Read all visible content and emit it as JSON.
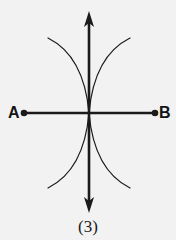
{
  "figure": {
    "caption": "(3)",
    "background_color": "#f2f2f2",
    "ink_color": "#1a1a1a",
    "width": 176,
    "height": 240,
    "points": [
      {
        "id": "A",
        "label": "A",
        "x": 24,
        "y": 113
      },
      {
        "id": "B",
        "label": "B",
        "x": 155,
        "y": 113
      }
    ],
    "origin": {
      "x": 89,
      "y": 113
    },
    "vertical_axis": {
      "name": "vertical-double-arrow",
      "x": 89,
      "y_top": 12,
      "y_bottom": 212,
      "arrowheads": "both",
      "stroke_width": 2.6
    },
    "horizontal_axis": {
      "name": "segment-AB",
      "y": 113,
      "x_left": 24,
      "x_right": 155,
      "arrowheads": "none",
      "endpoint_dots": true,
      "dot_radius": 3.2,
      "stroke_width": 2.6
    },
    "curves": [
      {
        "name": "upper-left-branch",
        "from": {
          "x": 48,
          "y": 38
        },
        "to": {
          "x": 89,
          "y": 113
        },
        "control": {
          "x": 84,
          "y": 56
        },
        "stroke_width": 1.2
      },
      {
        "name": "upper-right-branch",
        "from": {
          "x": 130,
          "y": 38
        },
        "to": {
          "x": 89,
          "y": 113
        },
        "control": {
          "x": 94,
          "y": 56
        },
        "stroke_width": 1.2
      },
      {
        "name": "lower-left-branch",
        "from": {
          "x": 48,
          "y": 188
        },
        "to": {
          "x": 89,
          "y": 113
        },
        "control": {
          "x": 84,
          "y": 170
        },
        "stroke_width": 1.2
      },
      {
        "name": "lower-right-branch",
        "from": {
          "x": 130,
          "y": 188
        },
        "to": {
          "x": 89,
          "y": 113
        },
        "control": {
          "x": 94,
          "y": 170
        },
        "stroke_width": 1.2
      }
    ]
  }
}
